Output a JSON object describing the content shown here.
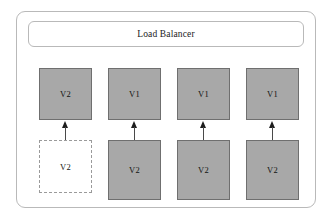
{
  "diagram": {
    "type": "deployment-diagram",
    "colors": {
      "box_fill": "#a8a8a8",
      "box_border": "#6f6f6f",
      "dashed_border": "#9a9a9a",
      "container_border": "#b9b9b9",
      "arrow": "#1d1d1d",
      "background": "#ffffff",
      "text": "#111111"
    },
    "load_balancer": {
      "label": "Load Balancer"
    },
    "rows": {
      "top_label": "top-row-instances",
      "bottom_label": "bottom-row-instances"
    },
    "columns": [
      {
        "index": 1,
        "top": {
          "label": "V2",
          "style": "filled"
        },
        "bottom": {
          "label": "V2",
          "style": "dashed"
        },
        "arrow": {
          "direction": "up",
          "present": true
        }
      },
      {
        "index": 2,
        "top": {
          "label": "V1",
          "style": "filled"
        },
        "bottom": {
          "label": "V2",
          "style": "filled"
        },
        "arrow": {
          "direction": "up",
          "present": true
        }
      },
      {
        "index": 3,
        "top": {
          "label": "V1",
          "style": "filled"
        },
        "bottom": {
          "label": "V2",
          "style": "filled"
        },
        "arrow": {
          "direction": "up",
          "present": true
        }
      },
      {
        "index": 4,
        "top": {
          "label": "V1",
          "style": "filled"
        },
        "bottom": {
          "label": "V2",
          "style": "filled"
        },
        "arrow": {
          "direction": "up",
          "present": true
        }
      }
    ]
  }
}
